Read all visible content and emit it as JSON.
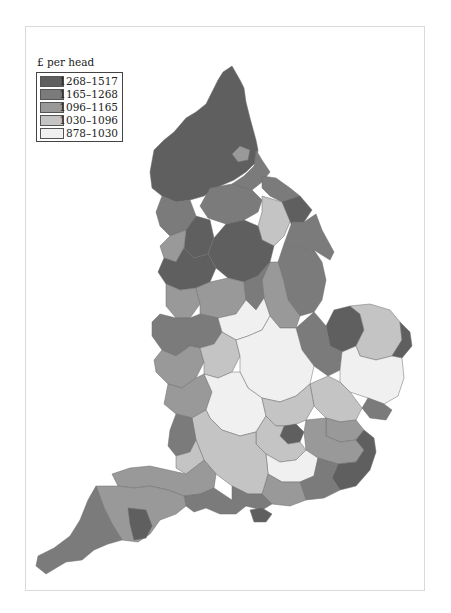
{
  "legend": {
    "title": "£ per head",
    "items": [
      {
        "label": "1268–1517",
        "color": "#5f5f5f"
      },
      {
        "label": "1165–1268",
        "color": "#7b7b7b"
      },
      {
        "label": "1096–1165",
        "color": "#999999"
      },
      {
        "label": "1030–1096",
        "color": "#c4c4c4"
      },
      {
        "label": "878–1030",
        "color": "#f0f0f0"
      }
    ]
  },
  "map": {
    "subject": "England local authority areas shaded by £ per head",
    "regions": [
      {
        "name": "far-north",
        "class": 0,
        "d": "M223,72 L232,66 L240,80 L244,88 L246,102 L250,118 L256,140 L258,150 L256,162 L246,172 L234,180 L220,186 L204,196 L190,200 L176,202 L162,196 L152,188 L150,172 L154,150 L164,140 L174,132 L186,118 L196,112 L206,104 L212,92 L218,80 Z"
      },
      {
        "name": "north-east-mid",
        "class": 1,
        "d": "M256,150 L262,160 L270,172 L262,182 L252,190 L240,188 L232,184 L244,176 L254,166 Z"
      },
      {
        "name": "tyne",
        "class": 2,
        "d": "M240,146 L250,150 L248,160 L238,162 L232,154 Z"
      },
      {
        "name": "teesside",
        "class": 1,
        "d": "M262,176 L276,178 L290,188 L300,196 L296,204 L282,202 L270,196 L262,188 Z"
      },
      {
        "name": "north-yorks-west",
        "class": 1,
        "d": "M210,188 L232,184 L252,190 L262,200 L258,212 L244,220 L226,224 L208,218 L200,206 Z"
      },
      {
        "name": "north-yorks-light",
        "class": 3,
        "d": "M262,196 L282,202 L296,206 L290,222 L284,236 L274,246 L262,240 L258,226 L262,212 Z"
      },
      {
        "name": "north-yorks-east",
        "class": 0,
        "d": "M282,202 L300,196 L312,210 L304,222 L292,226 Z"
      },
      {
        "name": "east-riding",
        "class": 1,
        "d": "M292,222 L304,222 L316,214 L322,230 L334,252 L330,260 L314,250 L298,248 L284,244 Z"
      },
      {
        "name": "cumbria-south",
        "class": 1,
        "d": "M162,196 L176,202 L190,200 L196,216 L186,230 L170,236 L160,226 L156,212 Z"
      },
      {
        "name": "lancs-north",
        "class": 0,
        "d": "M186,230 L196,216 L210,220 L214,238 L208,254 L194,258 L184,248 Z"
      },
      {
        "name": "lancs-mid",
        "class": 2,
        "d": "M170,236 L186,230 L184,248 L176,262 L164,258 L160,246 Z"
      },
      {
        "name": "west-yorks",
        "class": 0,
        "d": "M208,254 L214,238 L226,224 L244,220 L258,226 L262,240 L274,246 L270,262 L258,276 L244,282 L228,278 L216,268 Z"
      },
      {
        "name": "lincs-north",
        "class": 1,
        "d": "M284,244 L298,248 L314,250 L322,262 L326,280 L322,300 L314,312 L300,316 L288,300 L284,282 L278,262 Z"
      },
      {
        "name": "lincs-south",
        "class": 2,
        "d": "M270,262 L278,262 L284,282 L288,300 L300,316 L296,328 L280,328 L270,316 L264,298 L262,280 Z"
      },
      {
        "name": "merseyside-manchester",
        "class": 0,
        "d": "M164,258 L176,262 L184,248 L194,258 L208,254 L216,268 L210,282 L196,288 L180,290 L166,284 L158,272 Z"
      },
      {
        "name": "cheshire",
        "class": 2,
        "d": "M166,284 L180,290 L196,288 L200,304 L190,318 L176,318 L166,306 Z"
      },
      {
        "name": "derbys-staffs",
        "class": 2,
        "d": "M196,288 L210,282 L228,278 L244,282 L246,300 L236,314 L218,318 L200,314 L200,304 Z"
      },
      {
        "name": "notts",
        "class": 1,
        "d": "M244,282 L258,276 L270,262 L262,280 L264,298 L256,310 L246,300 Z"
      },
      {
        "name": "shropshire",
        "class": 1,
        "d": "M160,314 L176,318 L190,318 L196,330 L190,346 L176,356 L162,350 L152,336 L152,322 Z"
      },
      {
        "name": "west-midlands",
        "class": 1,
        "d": "M190,318 L200,314 L218,318 L222,332 L214,344 L200,348 L190,346 L196,330 Z"
      },
      {
        "name": "leics",
        "class": 4,
        "d": "M218,318 L236,314 L246,300 L256,310 L264,298 L270,316 L262,330 L248,336 L236,340 L222,332 Z"
      },
      {
        "name": "norfolk-west",
        "class": 0,
        "d": "M334,310 L350,306 L360,314 L364,330 L356,346 L342,352 L330,346 L326,326 Z"
      },
      {
        "name": "norfolk-mid",
        "class": 3,
        "d": "M350,306 L370,304 L390,310 L400,322 L402,340 L392,356 L376,360 L360,356 L356,346 L364,330 L360,314 Z"
      },
      {
        "name": "norfolk-east",
        "class": 0,
        "d": "M400,322 L410,332 L412,346 L402,358 L392,356 L402,340 Z"
      },
      {
        "name": "cambs-fens",
        "class": 1,
        "d": "M296,328 L314,312 L326,326 L330,346 L342,352 L340,370 L328,376 L314,366 L302,350 Z"
      },
      {
        "name": "suffolk",
        "class": 4,
        "d": "M342,352 L356,346 L360,356 L376,360 L392,356 L402,358 L404,378 L398,396 L384,404 L368,398 L350,392 L340,382 L340,370 Z"
      },
      {
        "name": "suffolk-south",
        "class": 1,
        "d": "M368,398 L384,404 L392,410 L386,420 L370,418 L362,408 Z"
      },
      {
        "name": "herefs-worcs",
        "class": 2,
        "d": "M162,350 L176,356 L190,346 L200,348 L204,362 L196,378 L182,388 L168,384 L156,372 L154,360 Z"
      },
      {
        "name": "warwicks",
        "class": 3,
        "d": "M200,348 L214,344 L222,332 L236,340 L240,356 L232,372 L218,378 L204,374 L204,362 Z"
      },
      {
        "name": "midlands-east",
        "class": 4,
        "d": "M236,340 L248,336 L262,330 L270,316 L280,328 L296,328 L302,350 L314,366 L310,384 L296,396 L280,402 L262,398 L248,388 L240,372 L240,356 Z"
      },
      {
        "name": "essex-north",
        "class": 3,
        "d": "M310,384 L328,376 L340,382 L350,392 L362,408 L356,420 L340,422 L326,418 L314,406 Z"
      },
      {
        "name": "gloucs",
        "class": 2,
        "d": "M168,384 L182,388 L196,378 L204,374 L212,392 L206,410 L192,418 L176,414 L164,404 Z"
      },
      {
        "name": "oxon-bucks",
        "class": 4,
        "d": "M204,374 L218,378 L232,372 L240,372 L248,388 L262,398 L266,416 L256,432 L240,436 L222,430 L210,418 L206,410 L212,392 Z"
      },
      {
        "name": "herts",
        "class": 3,
        "d": "M262,398 L280,402 L296,396 L310,384 L314,406 L306,420 L292,426 L276,426 L266,416 Z"
      },
      {
        "name": "essex-south",
        "class": 2,
        "d": "M326,418 L340,422 L356,420 L364,430 L356,440 L340,442 L326,436 Z"
      },
      {
        "name": "london",
        "class": 0,
        "d": "M284,426 L296,424 L304,432 L300,442 L288,444 L280,436 Z"
      },
      {
        "name": "london-outer",
        "class": 3,
        "d": "M266,416 L276,426 L284,426 L280,436 L288,444 L300,442 L306,450 L296,460 L280,462 L266,454 L256,444 L256,432 Z"
      },
      {
        "name": "kent-north",
        "class": 2,
        "d": "M306,420 L326,418 L326,436 L340,442 L356,440 L364,450 L356,462 L338,464 L318,458 L306,450 L304,432 Z"
      },
      {
        "name": "kent-east",
        "class": 0,
        "d": "M356,440 L364,430 L374,438 L376,452 L370,470 L356,486 L340,490 L332,478 L338,464 L356,462 L364,450 Z"
      },
      {
        "name": "surrey",
        "class": 4,
        "d": "M266,454 L280,462 L296,460 L306,450 L318,458 L314,476 L300,482 L282,482 L268,474 Z"
      },
      {
        "name": "sussex-east",
        "class": 1,
        "d": "M314,476 L318,458 L338,464 L332,478 L340,490 L324,498 L306,500 L300,482 Z"
      },
      {
        "name": "sussex-west",
        "class": 2,
        "d": "M268,474 L282,482 L300,482 L306,500 L290,506 L272,504 L262,494 Z"
      },
      {
        "name": "berks-wilts",
        "class": 3,
        "d": "M206,410 L210,418 L222,430 L240,436 L256,432 L256,444 L266,454 L268,474 L262,494 L248,494 L232,486 L216,474 L204,460 L196,440 L192,418 Z"
      },
      {
        "name": "hampshire",
        "class": 1,
        "d": "M232,486 L248,494 L262,494 L272,504 L262,510 L246,506 L232,500 Z"
      },
      {
        "name": "isle-of-wight",
        "class": 0,
        "d": "M250,510 L262,508 L272,514 L266,522 L254,522 Z"
      },
      {
        "name": "somerset",
        "class": 2,
        "d": "M112,474 L130,468 L150,466 L168,470 L186,474 L204,460 L216,474 L214,488 L200,494 L184,496 L168,490 L150,486 L134,488 L118,486 Z"
      },
      {
        "name": "bristol-area",
        "class": 1,
        "d": "M176,414 L192,418 L196,440 L190,452 L176,456 L168,446 L170,430 Z"
      },
      {
        "name": "wilts-south",
        "class": 3,
        "d": "M190,452 L196,440 L204,460 L186,474 L176,468 L176,456 Z"
      },
      {
        "name": "dorset",
        "class": 1,
        "d": "M184,496 L200,494 L214,488 L232,500 L246,506 L236,514 L220,514 L206,508 L194,512 L186,506 Z"
      },
      {
        "name": "devon",
        "class": 2,
        "d": "M96,486 L118,486 L134,488 L150,486 L168,490 L184,496 L186,506 L176,514 L160,520 L150,534 L138,542 L122,540 L112,524 L104,508 Z"
      },
      {
        "name": "torbay",
        "class": 0,
        "d": "M128,508 L146,510 L152,526 L146,538 L134,540 L130,524 Z"
      },
      {
        "name": "cornwall",
        "class": 1,
        "d": "M96,486 L104,508 L112,524 L122,540 L108,544 L94,550 L82,560 L66,562 L56,568 L46,574 L36,566 L38,556 L54,548 L70,536 L80,520 L88,500 Z"
      }
    ]
  }
}
